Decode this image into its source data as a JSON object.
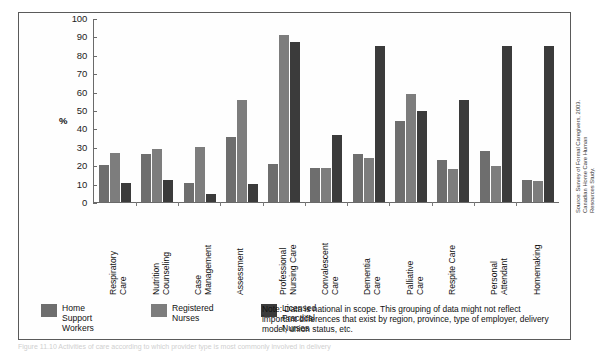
{
  "chart_data": {
    "type": "bar",
    "title": "",
    "xlabel": "",
    "ylabel": "%",
    "ylim": [
      0,
      100
    ],
    "ytick_step": 10,
    "grid": false,
    "legend_position": "bottom-left",
    "categories": [
      "Respiratory\nCare",
      "Nutrition\nCounseling",
      "Case\nManagement",
      "Assessment",
      "Professional\nNursing Care",
      "Convalescent\nCare",
      "Dementia\nCare",
      "Palliative\nCare",
      "Respite Care",
      "Personal\nAttendant",
      "Homemaking"
    ],
    "yticks": [
      100,
      90,
      80,
      70,
      60,
      50,
      40,
      30,
      20,
      10,
      0
    ],
    "series": [
      {
        "name": "Home Support Workers",
        "color": "#6e6e6e",
        "values": [
          20,
          26,
          10.5,
          35.5,
          21,
          18.5,
          26.5,
          44,
          23,
          28,
          12
        ]
      },
      {
        "name": "Registered Nurses",
        "color": "#7d7d7d",
        "values": [
          27,
          29,
          30,
          56,
          91.5,
          18.5,
          24,
          59,
          18,
          19.5,
          11.5
        ]
      },
      {
        "name": "Licensed Practical Nurses",
        "color": "#3b3b3b",
        "values": [
          10.5,
          12,
          4.5,
          10,
          87.5,
          36.5,
          85,
          50,
          56,
          85,
          85
        ]
      }
    ]
  },
  "axis": {
    "y_axis_title": "%"
  },
  "legend": [
    {
      "label": "Home\nSupport\nWorkers",
      "swatch": "hsw"
    },
    {
      "label": "Registered\nNurses",
      "swatch": "rn"
    },
    {
      "label": "Licensed\nPractical\nNurses",
      "swatch": "lpn"
    }
  ],
  "note": {
    "text": "Note: Data is national in scope. This grouping of data might not reflect important differences that exist by region, province, type of employer, delivery model, union status, etc."
  },
  "source": {
    "text": "Source: Survey of Formal Caregivers, 2003. Canadian Home Care Human\nResources Study."
  },
  "caption": {
    "text": "Figure 11.10 Activities of care according to which provider type is most commonly involved in delivery"
  }
}
